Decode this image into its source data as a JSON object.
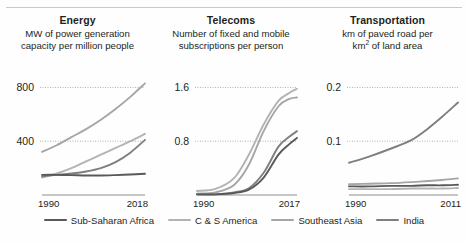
{
  "series_colors": {
    "Sub-Saharan Africa": "#595959",
    "C & S America": "#b3b3b3",
    "Southeast Asia": "#a6a6a6",
    "India": "#7f7f7f"
  },
  "legend": {
    "items": [
      {
        "label": "Sub-Saharan Africa",
        "color": "#595959"
      },
      {
        "label": "C & S America",
        "color": "#b3b3b3"
      },
      {
        "label": "Southeast Asia",
        "color": "#a6a6a6"
      },
      {
        "label": "India",
        "color": "#7f7f7f"
      }
    ]
  },
  "chart_data": [
    {
      "type": "line",
      "title": "Energy",
      "subtitle": "MW of power generation\ncapacity per million people",
      "xlabel": "",
      "ylabel": "",
      "xlim": [
        1990,
        2018
      ],
      "ylim": [
        0,
        900
      ],
      "xticks": [
        1990,
        2018
      ],
      "xticklabels": [
        "1990",
        "2018"
      ],
      "yticks": [
        400,
        800
      ],
      "yticklabels": [
        "400",
        "800"
      ],
      "grid": "horizontal-dotted",
      "legend_position": "bottom",
      "x": [
        1990,
        1994,
        1998,
        2002,
        2006,
        2010,
        2014,
        2018
      ],
      "series": [
        {
          "name": "Southeast Asia",
          "values": [
            320,
            370,
            430,
            490,
            560,
            640,
            730,
            830
          ]
        },
        {
          "name": "C & S America",
          "values": [
            130,
            160,
            200,
            250,
            300,
            350,
            400,
            455
          ]
        },
        {
          "name": "India",
          "values": [
            140,
            150,
            160,
            175,
            200,
            245,
            315,
            410
          ]
        },
        {
          "name": "Sub-Saharan Africa",
          "values": [
            150,
            150,
            148,
            145,
            145,
            148,
            152,
            158
          ]
        }
      ]
    },
    {
      "type": "line",
      "title": "Telecoms",
      "subtitle": "Number of fixed and mobile\nsubscriptions per person",
      "xlabel": "",
      "ylabel": "",
      "xlim": [
        1990,
        2017
      ],
      "ylim": [
        0,
        1.8
      ],
      "xticks": [
        1990,
        2017
      ],
      "xticklabels": [
        "1990",
        "2017"
      ],
      "yticks": [
        0.8,
        1.6
      ],
      "yticklabels": [
        "0.8",
        "1.6"
      ],
      "grid": "horizontal-dotted",
      "legend_position": "bottom",
      "x": [
        1990,
        1995,
        2000,
        2004,
        2008,
        2012,
        2015,
        2017
      ],
      "series": [
        {
          "name": "C & S America",
          "values": [
            0.06,
            0.09,
            0.25,
            0.6,
            1.05,
            1.4,
            1.52,
            1.58
          ]
        },
        {
          "name": "Southeast Asia",
          "values": [
            0.02,
            0.04,
            0.15,
            0.45,
            0.95,
            1.32,
            1.43,
            1.45
          ]
        },
        {
          "name": "India",
          "values": [
            0.01,
            0.01,
            0.04,
            0.1,
            0.33,
            0.72,
            0.87,
            0.95
          ]
        },
        {
          "name": "Sub-Saharan Africa",
          "values": [
            0.01,
            0.01,
            0.03,
            0.08,
            0.26,
            0.6,
            0.76,
            0.85
          ]
        }
      ]
    },
    {
      "type": "line",
      "title": "Transportation",
      "subtitle": "km of paved road per\nkm² of land area",
      "xlabel": "",
      "ylabel": "",
      "xlim": [
        1990,
        2011
      ],
      "ylim": [
        0,
        0.225
      ],
      "xticks": [
        1990,
        2011
      ],
      "xticklabels": [
        "1990",
        "2011"
      ],
      "yticks": [
        0.1,
        0.2
      ],
      "yticklabels": [
        "0.1",
        "0.2"
      ],
      "grid": "horizontal-dotted",
      "legend_position": "bottom",
      "x": [
        1990,
        1994,
        1998,
        2002,
        2005,
        2008,
        2011
      ],
      "series": [
        {
          "name": "India",
          "values": [
            0.06,
            0.072,
            0.086,
            0.102,
            0.122,
            0.146,
            0.172
          ]
        },
        {
          "name": "Southeast Asia",
          "values": [
            0.02,
            0.021,
            0.022,
            0.024,
            0.026,
            0.028,
            0.031
          ]
        },
        {
          "name": "Sub-Saharan Africa",
          "values": [
            0.016,
            0.016,
            0.017,
            0.017,
            0.018,
            0.018,
            0.019
          ]
        },
        {
          "name": "C & S America",
          "values": [
            0.011,
            0.011,
            0.011,
            0.012,
            0.012,
            0.012,
            0.013
          ]
        }
      ]
    }
  ]
}
